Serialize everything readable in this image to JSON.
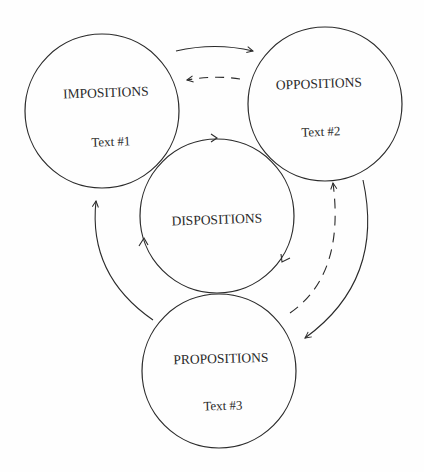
{
  "diagram": {
    "nodes": [
      {
        "id": "impositions",
        "label": "IMPOSITIONS",
        "sublabel": "Text #1"
      },
      {
        "id": "oppositions",
        "label": "OPPOSITIONS",
        "sublabel": "Text #2"
      },
      {
        "id": "dispositions",
        "label": "DISPOSITIONS",
        "sublabel": ""
      },
      {
        "id": "propositions",
        "label": "PROPOSITIONS",
        "sublabel": "Text #3"
      }
    ],
    "edges": [
      {
        "from": "impositions",
        "to": "oppositions",
        "style": "solid"
      },
      {
        "from": "oppositions",
        "to": "impositions",
        "style": "dashed"
      },
      {
        "from": "oppositions",
        "to": "propositions",
        "style": "solid"
      },
      {
        "from": "propositions",
        "to": "oppositions",
        "style": "dashed"
      },
      {
        "from": "propositions",
        "to": "impositions",
        "style": "solid"
      },
      {
        "from": "dispositions",
        "to": "dispositions",
        "style": "solid-cycle"
      }
    ],
    "colors": {
      "stroke": "#2a2a2a",
      "background": "#fefefe"
    }
  }
}
